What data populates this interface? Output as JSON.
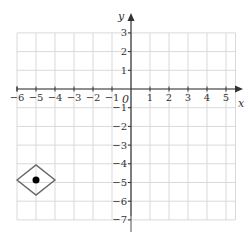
{
  "chart_data": {
    "type": "scatter",
    "title": "",
    "xlabel": "x",
    "ylabel": "y",
    "xlim": [
      -6,
      5
    ],
    "ylim": [
      -7,
      3
    ],
    "grid": true,
    "x_ticks": [
      -6,
      -5,
      -4,
      -3,
      -2,
      -1,
      1,
      2,
      3,
      4,
      5
    ],
    "y_ticks": [
      3,
      2,
      1,
      -1,
      -2,
      -3,
      -4,
      -5,
      -6,
      -7
    ],
    "origin_label": "0",
    "points": [
      {
        "x": -5,
        "y": -5,
        "marker": "filled-circle"
      }
    ],
    "annotations": [
      {
        "type": "diamond",
        "center": [
          -5,
          -5
        ],
        "half_width": 1,
        "half_height": 0.8
      }
    ]
  },
  "labels": {
    "x_axis": "x",
    "y_axis": "y",
    "origin": "0",
    "x_ticks": [
      "−6",
      "−5",
      "−4",
      "−3",
      "−2",
      "−1",
      "1",
      "2",
      "3",
      "4",
      "5"
    ],
    "y_ticks": [
      "3",
      "2",
      "1",
      "−1",
      "−2",
      "−3",
      "−4",
      "−5",
      "−6",
      "−7"
    ]
  },
  "colors": {
    "grid": "#d9d9d9",
    "axis": "#333333",
    "diamond": "#666666",
    "point": "#000000"
  }
}
